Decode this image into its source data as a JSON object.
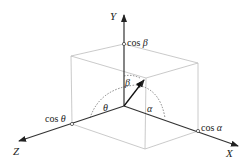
{
  "diagram": {
    "axes": {
      "x": {
        "label": "X"
      },
      "y": {
        "label": "Y"
      },
      "z": {
        "label": "Z"
      }
    },
    "points": {
      "cos_alpha": {
        "fn": "cos",
        "sym": "α"
      },
      "cos_beta": {
        "fn": "cos",
        "sym": "β"
      },
      "cos_theta": {
        "fn": "cos",
        "sym": "θ"
      }
    },
    "angles": {
      "alpha": "α",
      "beta": "β",
      "theta": "θ"
    },
    "colors": {
      "axis": "#333333",
      "box": "#bbbbbb",
      "arc": "#555555",
      "vector": "#111111"
    }
  }
}
